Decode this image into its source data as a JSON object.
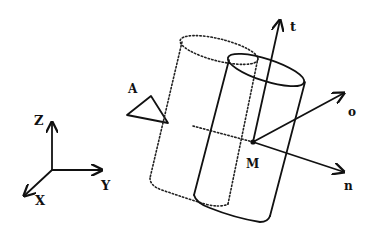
{
  "diagram": {
    "world_frame": {
      "axes": [
        {
          "name": "Z",
          "label": "Z"
        },
        {
          "name": "Y",
          "label": "Y"
        },
        {
          "name": "X",
          "label": "X"
        }
      ]
    },
    "object_A": {
      "label": "A",
      "shape": "triangle"
    },
    "cylinder_dotted": {
      "style": "dotted",
      "description": "previous cylinder pose"
    },
    "cylinder_solid": {
      "style": "solid",
      "description": "current cylinder pose"
    },
    "point": {
      "label": "M"
    },
    "local_frame": {
      "axes": [
        {
          "name": "t",
          "label": "t"
        },
        {
          "name": "o",
          "label": "o"
        },
        {
          "name": "n",
          "label": "n"
        }
      ]
    },
    "colors": {
      "ink": "#111111",
      "background": "#ffffff"
    }
  }
}
